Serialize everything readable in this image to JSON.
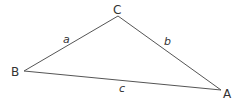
{
  "diagram": {
    "type": "triangle",
    "vertices": [
      {
        "label": "A",
        "x": 221,
        "y": 90
      },
      {
        "label": "B",
        "x": 24,
        "y": 71
      },
      {
        "label": "C",
        "x": 118,
        "y": 16
      }
    ],
    "sides": [
      {
        "label": "a",
        "from": "B",
        "to": "C"
      },
      {
        "label": "b",
        "from": "C",
        "to": "A"
      },
      {
        "label": "c",
        "from": "B",
        "to": "A"
      }
    ],
    "stroke_color": "#555555"
  }
}
